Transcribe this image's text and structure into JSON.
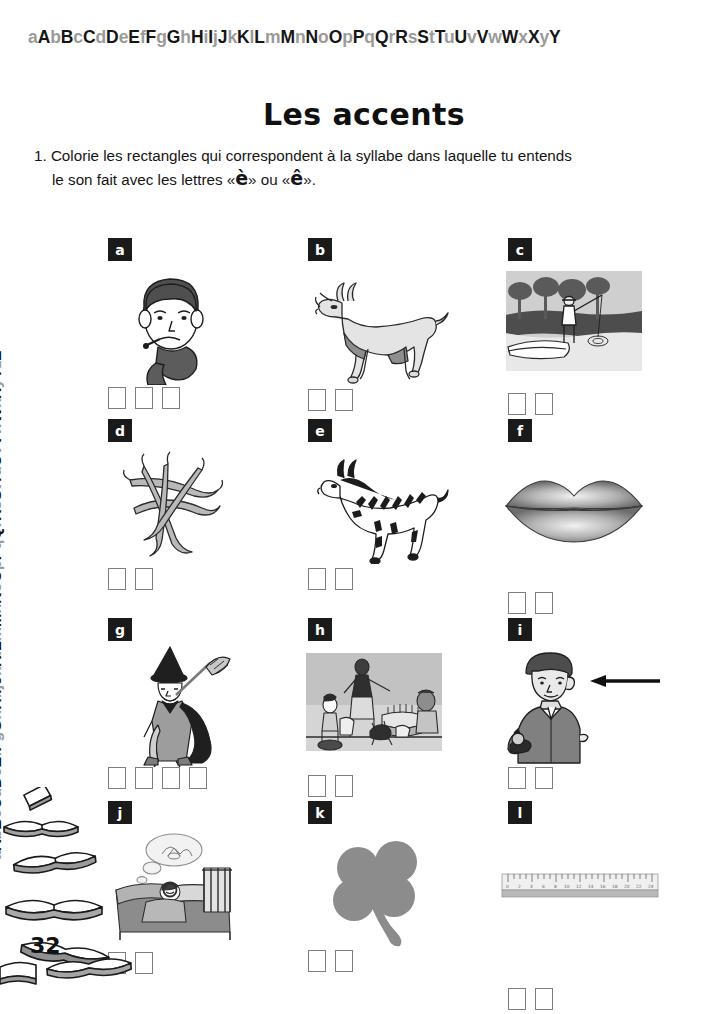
{
  "decor": {
    "alphabet_top": "aAbBcCdDeEfFgGhHiIjJkKlLmMnNoOpPqQrRsStTuUvVwWxXyY",
    "alphabet_left": "aAbBcCdDeEfFgGhHiIjJkKlLmMnNoOpPqQrRsStTuUvVwWxXyYzZ",
    "books_label": "stack-of-open-books"
  },
  "header": {
    "title": "Les accents"
  },
  "instruction": {
    "number": "1.",
    "line1": "Colorie les rectangles qui correspondent à la syllabe dans laquelle tu entends",
    "line2_before": "le son fait avec les lettres «",
    "accent1": "è",
    "line2_mid": "» ou «",
    "accent2": "ê",
    "line2_after": "»."
  },
  "items": [
    {
      "tag": "a",
      "picture": "sick-child-with-thermometer-and-scarf",
      "boxes": 3
    },
    {
      "tag": "b",
      "picture": "goat",
      "boxes": 2
    },
    {
      "tag": "c",
      "picture": "fisherman-in-boat-by-lake",
      "boxes": 2
    },
    {
      "tag": "d",
      "picture": "green-beans",
      "boxes": 2
    },
    {
      "tag": "e",
      "picture": "zebra",
      "boxes": 2
    },
    {
      "tag": "f",
      "picture": "lips",
      "boxes": 2
    },
    {
      "tag": "g",
      "picture": "witch-with-broom-and-cape",
      "boxes": 4
    },
    {
      "tag": "h",
      "picture": "birthday-party-with-cake",
      "boxes": 2
    },
    {
      "tag": "i",
      "picture": "man-with-arrow-pointing-to-hair",
      "boxes": 2
    },
    {
      "tag": "j",
      "picture": "child-dreaming-in-bed",
      "boxes": 2
    },
    {
      "tag": "k",
      "picture": "four-leaf-clover",
      "boxes": 2
    },
    {
      "tag": "l",
      "picture": "ruler",
      "boxes": 2
    }
  ],
  "footer": {
    "page_number": "32"
  },
  "colors": {
    "ink": "#1a1a1a",
    "lowercase_gray": "#9a9a9a",
    "box_border": "#7d7d83",
    "art_mid": "#8f8f8f",
    "art_dark": "#4a4a4a",
    "art_light": "#c9c9c9"
  }
}
